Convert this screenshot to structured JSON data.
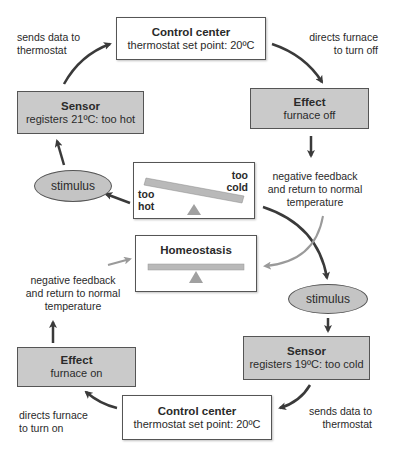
{
  "top_loop": {
    "control_center": {
      "title": "Control center",
      "detail": "thermostat set point: 20ºC"
    },
    "effect": {
      "title": "Effect",
      "detail": "furnace off"
    },
    "sensor": {
      "title": "Sensor",
      "detail": "registers 21ºC: too hot"
    },
    "stimulus": {
      "label": "stimulus"
    },
    "labels": {
      "sends_data": [
        "sends data to",
        "thermostat"
      ],
      "directs": [
        "directs furnace",
        "to turn off"
      ],
      "feedback": [
        "negative feedback",
        "and return to normal",
        "temperature"
      ]
    }
  },
  "imbalance": {
    "left_label": [
      "too",
      "hot"
    ],
    "right_label": [
      "too",
      "cold"
    ]
  },
  "homeostasis": {
    "title": "Homeostasis"
  },
  "bottom_loop": {
    "stimulus": {
      "label": "stimulus"
    },
    "sensor": {
      "title": "Sensor",
      "detail": "registers 19ºC: too cold"
    },
    "control_center": {
      "title": "Control center",
      "detail": "thermostat set point: 20ºC"
    },
    "effect": {
      "title": "Effect",
      "detail": "furnace on"
    },
    "labels": {
      "sends_data": [
        "sends data to",
        "thermostat"
      ],
      "directs": [
        "directs furnace",
        "to turn on"
      ],
      "feedback": [
        "negative feedback",
        "and return to normal",
        "temperature"
      ]
    }
  },
  "colors": {
    "box_gray": "#cacaca",
    "ellipse_gray": "#c4c4c4",
    "bar_gray": "#b9b9b9",
    "arrow_dark": "#3a3a3a",
    "arrow_light": "#a8a8a8"
  }
}
